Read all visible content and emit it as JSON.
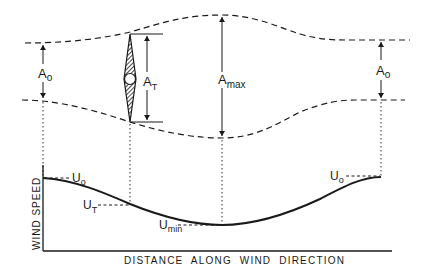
{
  "diagram": {
    "labels": {
      "a_o_left": {
        "main": "A",
        "sub": "o"
      },
      "a_t": {
        "main": "A",
        "sub": "T"
      },
      "a_max": {
        "main": "A",
        "sub": "max"
      },
      "a_o_right": {
        "main": "A",
        "sub": "o"
      },
      "u_o_left": {
        "main": "U",
        "sub": "o"
      },
      "u_t": {
        "main": "U",
        "sub": "T"
      },
      "u_min": {
        "main": "U",
        "sub": "min"
      },
      "u_o_right": {
        "main": "U",
        "sub": "o"
      }
    },
    "axes": {
      "y_label": "WIND SPEED",
      "x_label": "DISTANCE ALONG WIND DIRECTION"
    },
    "colors": {
      "ink": "#1a1a1a",
      "background": "#ffffff"
    }
  }
}
